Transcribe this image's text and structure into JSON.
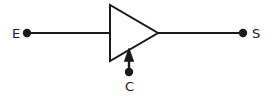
{
  "diagram": {
    "type": "schematic",
    "canvas": {
      "width": 274,
      "height": 99,
      "background_color": "#ffffff"
    },
    "style": {
      "stroke_color": "#1a1a1a",
      "stroke_width": 2,
      "node_radius": 4,
      "fill_color": "#ffffff"
    },
    "terminals": [
      {
        "id": "emitter",
        "label": "E",
        "label_x": 12,
        "label_y": 38,
        "node_x": 27,
        "node_y": 33
      },
      {
        "id": "control",
        "label": "C",
        "label_x": 125,
        "label_y": 91,
        "node_x": 129,
        "node_y": 72
      },
      {
        "id": "source",
        "label": "S",
        "label_x": 252,
        "label_y": 38,
        "node_x": 243,
        "node_y": 33
      }
    ],
    "shapes": {
      "triangle": {
        "name": "amplifier-triangle",
        "points": "110,5 110,61 158,33",
        "apex_x": 158,
        "apex_y": 33,
        "left_x": 110,
        "top_y": 5,
        "bottom_y": 61
      },
      "input_wire": {
        "name": "emitter-wire",
        "x1": 27,
        "y1": 33,
        "x2": 110,
        "y2": 33
      },
      "output_wire": {
        "name": "source-wire",
        "x1": 158,
        "y1": 33,
        "x2": 243,
        "y2": 33
      },
      "control_arrow": {
        "name": "control-arrow",
        "x": 129,
        "tip_y": 49,
        "tail_y": 72,
        "head_points": "129,49 124,61 134,61"
      }
    }
  }
}
